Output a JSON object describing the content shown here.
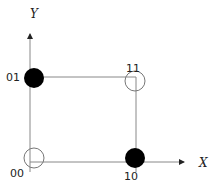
{
  "diagram": {
    "axes": {
      "x_label": "X",
      "y_label": "Y"
    },
    "points": [
      {
        "label": "00",
        "x": 0,
        "y": 0,
        "fill": "open"
      },
      {
        "label": "01",
        "x": 0,
        "y": 1,
        "fill": "filled"
      },
      {
        "label": "11",
        "x": 1,
        "y": 1,
        "fill": "open"
      },
      {
        "label": "10",
        "x": 1,
        "y": 0,
        "fill": "filled"
      }
    ],
    "colors": {
      "line": "#888888",
      "filled_point": "#000000",
      "open_point_stroke": "#777777"
    }
  }
}
